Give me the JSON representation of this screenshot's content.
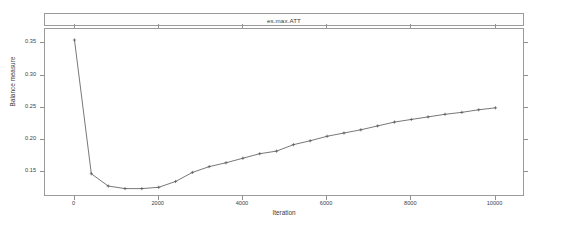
{
  "figure": {
    "strip_title": "es.max.ATT",
    "x_axis_title": "Iteration",
    "y_axis_title": "Balance measure",
    "line_color": "#555555",
    "frame_color": "#9a9a9a",
    "background": "#ffffff"
  },
  "chart_data": {
    "type": "line",
    "title": "es.max.ATT",
    "xlabel": "Iteration",
    "ylabel": "Balance measure",
    "xlim": [
      -700,
      10700
    ],
    "ylim": [
      0.112,
      0.372
    ],
    "xticks": [
      0,
      2000,
      4000,
      6000,
      8000,
      10000
    ],
    "xticklabels": [
      "0",
      "2000",
      "4000",
      "6000",
      "8000",
      "10000"
    ],
    "yticks": [
      0.15,
      0.2,
      0.25,
      0.3,
      0.35
    ],
    "yticklabels": [
      "0.15",
      "0.20",
      "0.25",
      "0.30",
      "0.35"
    ],
    "grid": false,
    "legend": false,
    "marker": "point",
    "series": [
      {
        "name": "es.max.ATT",
        "x": [
          0,
          400,
          800,
          1200,
          1600,
          2000,
          2400,
          2800,
          3200,
          3600,
          4000,
          4400,
          4800,
          5200,
          5600,
          6000,
          6400,
          6800,
          7200,
          7600,
          8000,
          8400,
          8800,
          9200,
          9600,
          10000
        ],
        "y": [
          0.355,
          0.148,
          0.129,
          0.125,
          0.125,
          0.127,
          0.136,
          0.15,
          0.159,
          0.165,
          0.172,
          0.179,
          0.183,
          0.193,
          0.199,
          0.206,
          0.211,
          0.216,
          0.222,
          0.228,
          0.232,
          0.236,
          0.24,
          0.243,
          0.247,
          0.25
        ]
      }
    ]
  }
}
